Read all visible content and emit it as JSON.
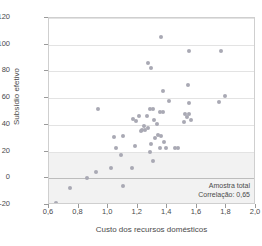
{
  "chart_data": {
    "type": "scatter",
    "title": "",
    "xlabel": "Custo dos recursos domésticos",
    "ylabel": "Subsídio efetivo",
    "xlim": [
      0.6,
      2.0
    ],
    "ylim": [
      -20,
      120
    ],
    "xticks": [
      "0,6",
      "0,8",
      "1,0",
      "1,2",
      "1,4",
      "1,6",
      "1,8",
      "2,0"
    ],
    "xtick_values": [
      0.6,
      0.8,
      1.0,
      1.2,
      1.4,
      1.6,
      1.8,
      2.0
    ],
    "yticks": [
      "-20",
      "0",
      "20",
      "40",
      "60",
      "80",
      "100",
      "120"
    ],
    "ytick_values": [
      -20,
      0,
      20,
      40,
      60,
      80,
      100,
      120
    ],
    "grid": true,
    "legend": "none",
    "marker_color": "#a9a9b4",
    "annotations": {
      "sample_label": "Amostra total",
      "correlation_label": "Correlação: 0,65"
    },
    "points": [
      [
        0.65,
        -18.5
      ],
      [
        0.74,
        -7.0
      ],
      [
        0.86,
        0.0
      ],
      [
        0.92,
        5.0
      ],
      [
        0.93,
        51.5
      ],
      [
        1.02,
        8.0
      ],
      [
        1.04,
        31.0
      ],
      [
        1.05,
        22.5
      ],
      [
        1.09,
        17.5
      ],
      [
        1.1,
        32.0
      ],
      [
        1.1,
        -5.5
      ],
      [
        1.16,
        8.0
      ],
      [
        1.17,
        44.5
      ],
      [
        1.18,
        24.5
      ],
      [
        1.19,
        43.0
      ],
      [
        1.21,
        47.0
      ],
      [
        1.22,
        35.5
      ],
      [
        1.23,
        36.5
      ],
      [
        1.24,
        39.5
      ],
      [
        1.25,
        36.0
      ],
      [
        1.26,
        46.5
      ],
      [
        1.27,
        86.0
      ],
      [
        1.27,
        38.0
      ],
      [
        1.28,
        51.5
      ],
      [
        1.28,
        20.0
      ],
      [
        1.29,
        82.5
      ],
      [
        1.29,
        26.0
      ],
      [
        1.3,
        51.5
      ],
      [
        1.3,
        13.0
      ],
      [
        1.31,
        44.0
      ],
      [
        1.32,
        30.5
      ],
      [
        1.33,
        40.5
      ],
      [
        1.34,
        32.5
      ],
      [
        1.35,
        50.0
      ],
      [
        1.35,
        22.5
      ],
      [
        1.36,
        105.5
      ],
      [
        1.36,
        31.5
      ],
      [
        1.37,
        65.0
      ],
      [
        1.37,
        49.5
      ],
      [
        1.38,
        27.5
      ],
      [
        1.39,
        22.5
      ],
      [
        1.41,
        57.5
      ],
      [
        1.45,
        22.5
      ],
      [
        1.47,
        22.5
      ],
      [
        1.51,
        42.0
      ],
      [
        1.52,
        48.5
      ],
      [
        1.53,
        46.0
      ],
      [
        1.54,
        69.5
      ],
      [
        1.55,
        95.0
      ],
      [
        1.55,
        56.0
      ],
      [
        1.55,
        48.5
      ],
      [
        1.56,
        44.0
      ],
      [
        1.75,
        57.0
      ],
      [
        1.76,
        95.0
      ],
      [
        1.79,
        61.5
      ]
    ]
  }
}
